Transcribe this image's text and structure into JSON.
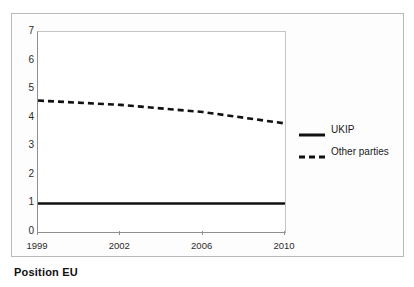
{
  "caption": "Position EU",
  "chart_data": {
    "type": "line",
    "title": "",
    "subtitle": "",
    "xlabel": "",
    "ylabel": "",
    "x": [
      1999,
      2002,
      2006,
      2010
    ],
    "categories": [
      "1999",
      "2002",
      "2006",
      "2010"
    ],
    "series": [
      {
        "name": "UKIP",
        "style": "solid",
        "color": "#111111",
        "values": [
          1.0,
          1.0,
          1.0,
          1.0
        ]
      },
      {
        "name": "Other parties",
        "style": "dashed",
        "color": "#111111",
        "values": [
          4.6,
          4.45,
          4.2,
          3.8
        ]
      }
    ],
    "xlim": [
      1999,
      2010
    ],
    "ylim": [
      0,
      7
    ],
    "yticks": [
      "0",
      "1",
      "2",
      "3",
      "4",
      "5",
      "6",
      "7"
    ],
    "xticks": [
      "1999",
      "2002",
      "2006",
      "2010"
    ],
    "grid": false,
    "legend_position": "right",
    "axis_color": "#8f8f8f",
    "plot_background": "#ffffff"
  },
  "legend": {
    "entries": [
      {
        "label": "UKIP",
        "style": "solid"
      },
      {
        "label": "Other parties",
        "style": "dashed"
      }
    ]
  },
  "axes": {
    "y_ticks": [
      {
        "label": "7",
        "value": 7
      },
      {
        "label": "6",
        "value": 6
      },
      {
        "label": "5",
        "value": 5
      },
      {
        "label": "4",
        "value": 4
      },
      {
        "label": "3",
        "value": 3
      },
      {
        "label": "2",
        "value": 2
      },
      {
        "label": "1",
        "value": 1
      },
      {
        "label": "0",
        "value": 0
      }
    ],
    "x_ticks": [
      {
        "label": "1999",
        "value": 1999
      },
      {
        "label": "2002",
        "value": 2002
      },
      {
        "label": "2006",
        "value": 2006
      },
      {
        "label": "2010",
        "value": 2010
      }
    ]
  }
}
